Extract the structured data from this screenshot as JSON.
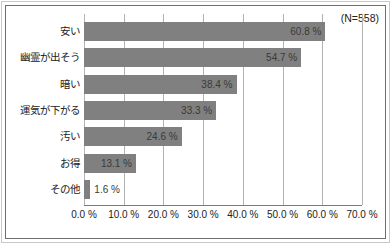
{
  "chart_data": {
    "type": "bar",
    "orientation": "horizontal",
    "title": "",
    "subtitle": "",
    "xlabel": "",
    "ylabel": "",
    "annotation": "(N=558)",
    "sample_size": 558,
    "categories": [
      "安い",
      "幽霊が出そう",
      "暗い",
      "運気が下がる",
      "汚い",
      "お得",
      "その他"
    ],
    "values": [
      60.8,
      54.7,
      38.4,
      33.3,
      24.6,
      13.1,
      1.6
    ],
    "value_labels": [
      "60.8 %",
      "54.7 %",
      "38.4 %",
      "33.3 %",
      "24.6 %",
      "13.1 %",
      "1.6 %"
    ],
    "xlim": [
      0,
      70
    ],
    "xticks": [
      0,
      10,
      20,
      30,
      40,
      50,
      60,
      70
    ],
    "xtick_labels": [
      "0.0 %",
      "10.0 %",
      "20.0 %",
      "30.0 %",
      "40.0 %",
      "50.0 %",
      "60.0 %",
      "70.0 %"
    ],
    "grid": "vertical",
    "legend": "none",
    "bar_color": "#808080",
    "gridline_color": "#b2b2b2",
    "axis_color": "#7a7a7a",
    "text_color": "#222222",
    "background_color": "#ffffff"
  }
}
